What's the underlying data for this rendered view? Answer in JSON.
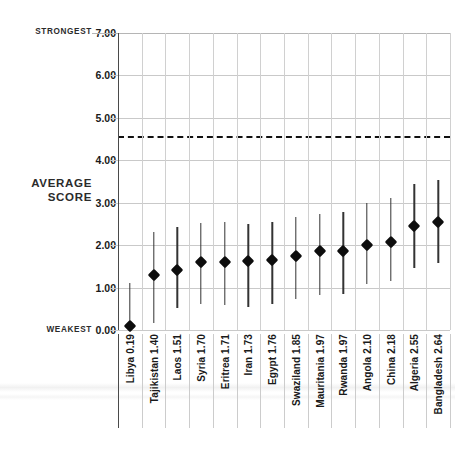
{
  "chart_data": {
    "type": "scatter",
    "title": "",
    "subtitle": "",
    "xlabel": "",
    "ylabel": "AVERAGE SCORE",
    "ylim": [
      0,
      7
    ],
    "ytick_labels": [
      "0.00",
      "1.00",
      "2.00",
      "3.00",
      "4.00",
      "5.00",
      "6.00",
      "7.00"
    ],
    "ytick_values": [
      0,
      1,
      2,
      3,
      4,
      5,
      6,
      7
    ],
    "grid": true,
    "legend_position": "none",
    "axis_annotations": {
      "top": "STRONGEST",
      "bottom": "WEAKEST",
      "axis_title": "AVERAGE SCORE"
    },
    "reference_line": {
      "value": 4.55,
      "style": "dashed",
      "color": "#111111",
      "label": ""
    },
    "categories": [
      "Libya",
      "Tajikistan",
      "Laos",
      "Syria",
      "Eritrea",
      "Iran",
      "Egypt",
      "Swaziland",
      "Mauritania",
      "Rwanda",
      "Angola",
      "China",
      "Algeria",
      "Bangladesh"
    ],
    "values": [
      0.19,
      1.4,
      1.51,
      1.7,
      1.71,
      1.73,
      1.76,
      1.85,
      1.97,
      1.97,
      2.1,
      2.18,
      2.55,
      2.64
    ],
    "tick_labels": [
      "Libya  0.19",
      "Tajikistan  1.40",
      "Laos  1.51",
      "Syria  1.70",
      "Eritrea  1.71",
      "Iran  1.73",
      "Egypt  1.76",
      "Swaziland  1.85",
      "Mauritania  1.97",
      "Rwanda  1.97",
      "Angola  2.10",
      "China  2.18",
      "Algeria  2.55",
      "Bangladesh  2.64"
    ],
    "error_low": [
      0.0,
      0.17,
      0.52,
      0.62,
      0.58,
      0.55,
      0.62,
      0.72,
      0.83,
      0.84,
      1.08,
      1.15,
      1.45,
      1.57
    ],
    "error_high": [
      1.1,
      2.3,
      2.43,
      2.52,
      2.55,
      2.5,
      2.55,
      2.66,
      2.73,
      2.77,
      3.0,
      3.1,
      3.43,
      3.53
    ],
    "marker_shape": "diamond",
    "marker_color": "#0d0d0d",
    "errorbar_color": "#333333",
    "grid_color": "#c9c9c9"
  }
}
